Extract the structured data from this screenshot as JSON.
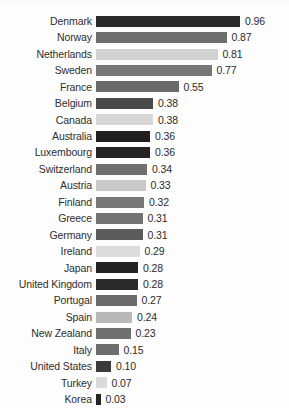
{
  "chart_data": {
    "type": "bar",
    "orientation": "horizontal",
    "title": "",
    "xlabel": "",
    "ylabel": "",
    "xlim": [
      0,
      1.0
    ],
    "grid": false,
    "legend": false,
    "categories": [
      "Denmark",
      "Norway",
      "Netherlands",
      "Sweden",
      "France",
      "Belgium",
      "Canada",
      "Australia",
      "Luxembourg",
      "Switzerland",
      "Austria",
      "Finland",
      "Greece",
      "Germany",
      "Ireland",
      "Japan",
      "United Kingdom",
      "Portugal",
      "Spain",
      "New Zealand",
      "Italy",
      "United States",
      "Turkey",
      "Korea"
    ],
    "values": [
      0.96,
      0.87,
      0.81,
      0.77,
      0.55,
      0.38,
      0.38,
      0.36,
      0.36,
      0.34,
      0.33,
      0.32,
      0.31,
      0.31,
      0.29,
      0.28,
      0.28,
      0.27,
      0.24,
      0.23,
      0.15,
      0.1,
      0.07,
      0.03
    ],
    "value_labels": [
      "0.96",
      "0.87",
      "0.81",
      "0.77",
      "0.55",
      "0.38",
      "0.38",
      "0.36",
      "0.36",
      "0.34",
      "0.33",
      "0.32",
      "0.31",
      "0.31",
      "0.29",
      "0.28",
      "0.28",
      "0.27",
      "0.24",
      "0.23",
      "0.15",
      "0.10",
      "0.07",
      "0.03"
    ],
    "bar_colors": [
      "#2a2a2a",
      "#6e6e6e",
      "#d2d2d2",
      "#777777",
      "#6a6a6a",
      "#4a4a4a",
      "#d6d6d6",
      "#1f1f1f",
      "#232323",
      "#6f6f6f",
      "#c9c9c9",
      "#767676",
      "#737373",
      "#5b5b5b",
      "#dcdcdc",
      "#232323",
      "#2a2a2a",
      "#6c6c6c",
      "#b9b9b9",
      "#707070",
      "#6d6d6d",
      "#3b3b3b",
      "#dadada",
      "#242424"
    ],
    "background_color": "#fdfdfd",
    "text_color": "#2e2e2e"
  }
}
